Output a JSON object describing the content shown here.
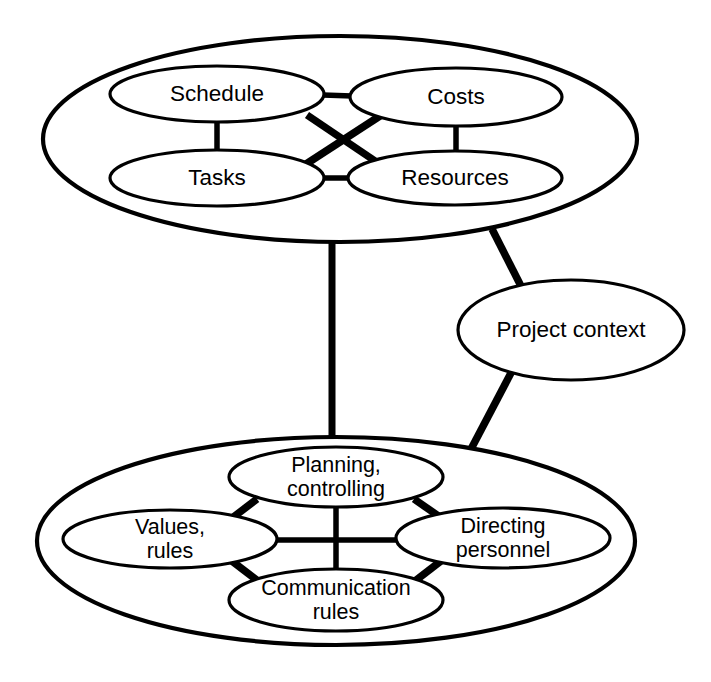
{
  "diagram": {
    "background_color": "#ffffff",
    "line_color": "#000000",
    "groups": [
      {
        "id": "hard-factors",
        "label": "",
        "nodes": [
          {
            "id": "schedule",
            "label": "Schedule"
          },
          {
            "id": "costs",
            "label": "Costs"
          },
          {
            "id": "tasks",
            "label": "Tasks"
          },
          {
            "id": "resources",
            "label": "Resources"
          }
        ]
      },
      {
        "id": "soft-factors",
        "label": "",
        "nodes": [
          {
            "id": "planning-controlling",
            "label_line1": "Planning,",
            "label_line2": "controlling"
          },
          {
            "id": "values-rules",
            "label_line1": "Values,",
            "label_line2": "rules"
          },
          {
            "id": "directing-personnel",
            "label_line1": "Directing",
            "label_line2": "personnel"
          },
          {
            "id": "communication-rules",
            "label_line1": "Communication",
            "label_line2": "rules"
          }
        ]
      }
    ],
    "standalone_nodes": [
      {
        "id": "project-context",
        "label": "Project context"
      }
    ],
    "connections": [
      {
        "from": "schedule",
        "to": "costs"
      },
      {
        "from": "tasks",
        "to": "resources"
      },
      {
        "from": "schedule",
        "to": "tasks"
      },
      {
        "from": "costs",
        "to": "resources"
      },
      {
        "from": "schedule",
        "to": "resources"
      },
      {
        "from": "costs",
        "to": "tasks"
      },
      {
        "from": "hard-factors",
        "to": "soft-factors"
      },
      {
        "from": "hard-factors",
        "to": "project-context"
      },
      {
        "from": "project-context",
        "to": "soft-factors"
      },
      {
        "from": "planning-controlling",
        "to": "values-rules"
      },
      {
        "from": "planning-controlling",
        "to": "directing-personnel"
      },
      {
        "from": "values-rules",
        "to": "communication-rules"
      },
      {
        "from": "directing-personnel",
        "to": "communication-rules"
      },
      {
        "from": "values-rules",
        "to": "directing-personnel"
      },
      {
        "from": "planning-controlling",
        "to": "communication-rules"
      }
    ]
  }
}
